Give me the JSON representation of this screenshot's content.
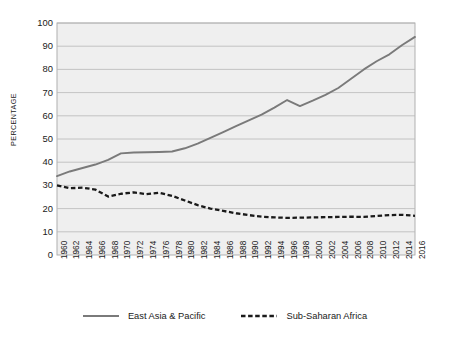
{
  "chart_data": {
    "type": "line",
    "title": "",
    "subtitle": "",
    "xlabel": "",
    "ylabel": "PERCENTAGE",
    "ylim": [
      0,
      100
    ],
    "xlim": [
      1960,
      2016
    ],
    "grid": "horizontal",
    "legend_position": "bottom",
    "yticks": [
      100,
      90,
      80,
      70,
      60,
      50,
      40,
      30,
      20,
      10,
      0
    ],
    "categories": [
      "1960",
      "1962",
      "1964",
      "1966",
      "1968",
      "1970",
      "1972",
      "1974",
      "1976",
      "1978",
      "1980",
      "1982",
      "1984",
      "1986",
      "1988",
      "1990",
      "1992",
      "1994",
      "1996",
      "1998",
      "2000",
      "2002",
      "2004",
      "2006",
      "2008",
      "2010",
      "2012",
      "2014",
      "2016"
    ],
    "series": [
      {
        "name": "East Asia & Pacific",
        "style": "solid",
        "color": "#7a7a7a",
        "values": [
          34,
          36,
          37.5,
          39,
          41,
          43.8,
          44.2,
          44.3,
          44.4,
          44.6,
          46,
          48,
          50.5,
          53,
          55.5,
          58,
          60.5,
          63.5,
          66.8,
          64.2,
          66.5,
          69,
          72,
          76,
          80,
          83.5,
          86.5,
          90.5,
          94
        ]
      },
      {
        "name": "Sub-Saharan Africa",
        "style": "dashed",
        "color": "#1a1a1a",
        "values": [
          30,
          28.8,
          29,
          28.2,
          25.2,
          26.4,
          27,
          26.2,
          26.8,
          25.5,
          23.5,
          21.5,
          20,
          19,
          18,
          17.2,
          16.5,
          16.2,
          16,
          16.1,
          16.2,
          16.3,
          16.4,
          16.5,
          16.4,
          16.8,
          17.2,
          17.3,
          16.9
        ]
      }
    ]
  },
  "plot": {
    "bg_color": "#efefef",
    "grid_color": "#b8b8b8",
    "border_color": "#a8a8a8"
  },
  "legend": {
    "entries": [
      {
        "label": "East Asia & Pacific",
        "style": "solid"
      },
      {
        "label": "Sub-Saharan Africa",
        "style": "dashed"
      }
    ]
  }
}
